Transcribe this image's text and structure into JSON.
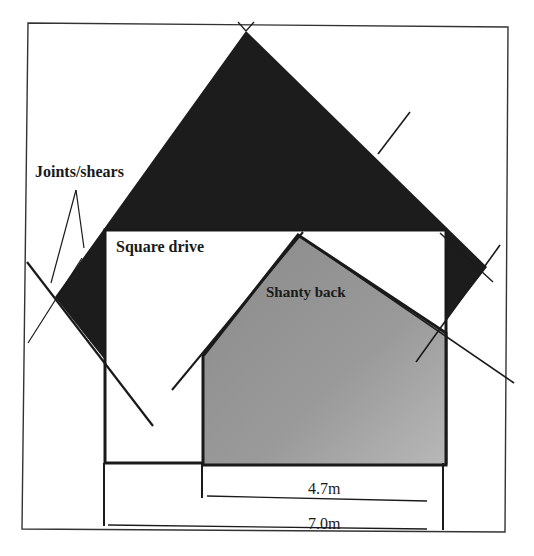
{
  "diagram": {
    "labels": {
      "joints": "Joints/shears",
      "square_drive": "Square drive",
      "shanty_back": "Shanty back"
    },
    "dimensions": {
      "inner_width": "4.7m",
      "outer_width": "7.0m"
    },
    "colors": {
      "dark_zone": "#1c1c1c",
      "shanty_fill": "#8f8f8f",
      "line": "#1a1a1a",
      "background": "#ffffff"
    }
  }
}
